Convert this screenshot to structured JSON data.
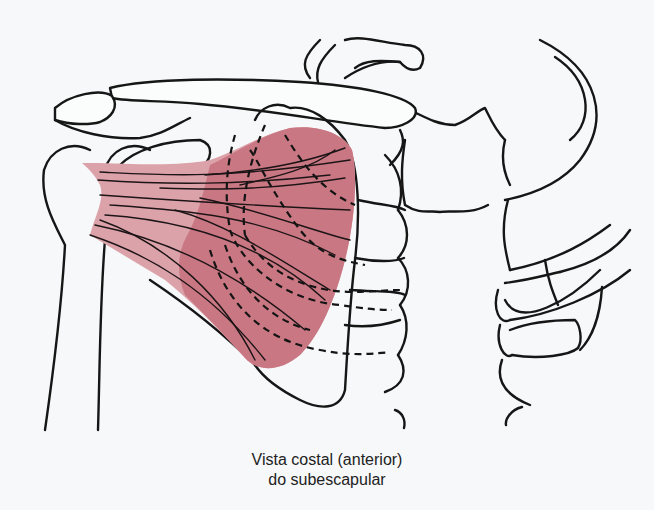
{
  "figure": {
    "caption": {
      "line1": "Vista costal (anterior)",
      "line2": "do subescapular"
    },
    "colors": {
      "muscle": "#c97883",
      "muscle_light": "#dca2aa",
      "outline": "#161616",
      "background": "#f7f8f9"
    },
    "structures": [
      "clavicle",
      "coracoid-process",
      "acromion",
      "humerus",
      "scapula",
      "subscapularis-muscle",
      "ribs",
      "sternum",
      "vertebral-column"
    ]
  }
}
